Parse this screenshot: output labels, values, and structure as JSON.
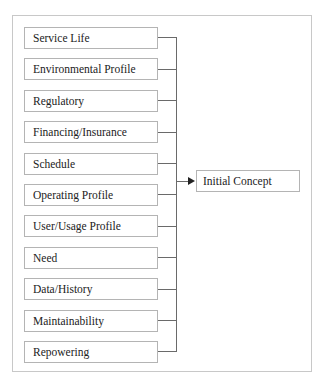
{
  "diagram": {
    "inputs": [
      {
        "label": "Service Life"
      },
      {
        "label": "Environmental Profile"
      },
      {
        "label": "Regulatory"
      },
      {
        "label": "Financing/Insurance"
      },
      {
        "label": "Schedule"
      },
      {
        "label": "Operating Profile"
      },
      {
        "label": "User/Usage Profile"
      },
      {
        "label": "Need"
      },
      {
        "label": "Data/History"
      },
      {
        "label": "Maintainability"
      },
      {
        "label": "Repowering"
      }
    ],
    "output": {
      "label": "Initial Concept"
    },
    "colors": {
      "box_border": "#b4b4b4",
      "connector": "#6a6a6a",
      "frame_border": "#c8c8c8",
      "text": "#222222"
    }
  }
}
